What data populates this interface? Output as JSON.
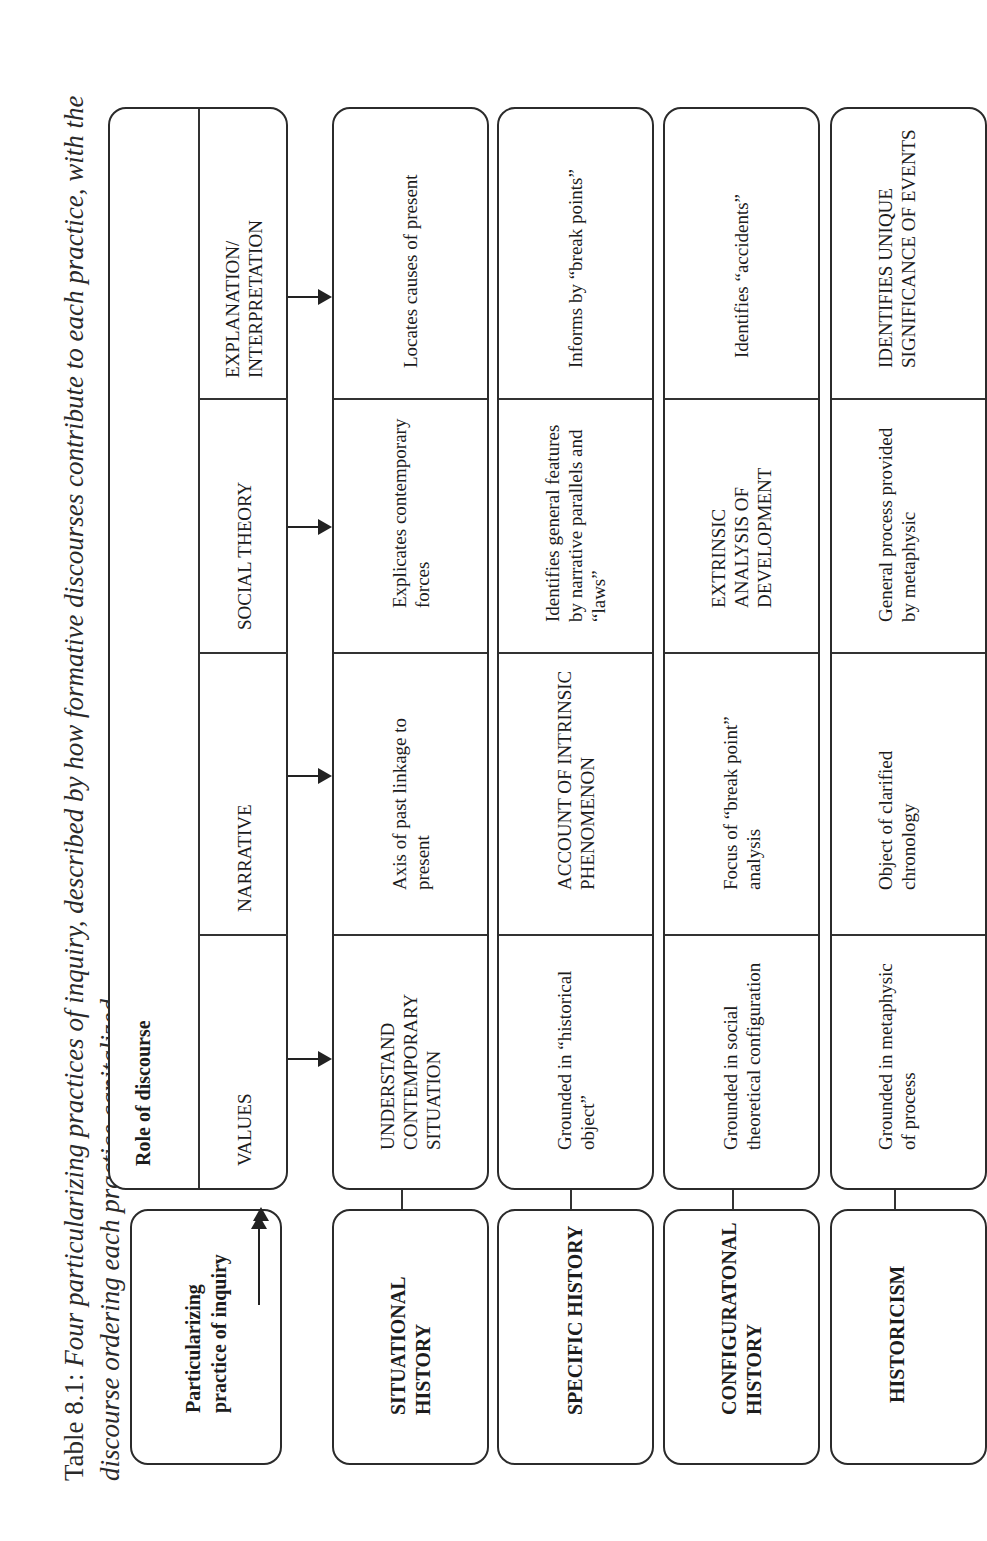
{
  "caption": {
    "label": "Table 8.1:",
    "text": "Four particularizing practices of inquiry, described by how formative discourses contribute to each practice, with the discourse ordering each practice capitalized"
  },
  "header": {
    "practice_label": "Particularizing practice of inquiry",
    "role_label": "Role of discourse",
    "columns": [
      "VALUES",
      "NARRATIVE",
      "SOCIAL THEORY",
      "EXPLANATION/ INTERPRETATION"
    ]
  },
  "rows": [
    {
      "practice": "SITUATIONAL HISTORY",
      "values": "UNDERSTAND CONTEMPORARY SITUATION",
      "narrative": "Axis of past linkage to present",
      "social_theory": "Explicates contemporary forces",
      "explanation": "Locates causes of present"
    },
    {
      "practice": "SPECIFIC HISTORY",
      "values": "Grounded in “historical object”",
      "narrative": "ACCOUNT OF INTRINSIC PHENOMENON",
      "social_theory": "Identifies general features by narrative parallels and “laws”",
      "explanation": "Informs by “break points”"
    },
    {
      "practice": "CONFIGURATONAL HISTORY",
      "values": "Grounded in social theoretical configuration",
      "narrative": "Focus of “break point” analysis",
      "social_theory": "EXTRINSIC ANALYSIS OF DEVELOPMENT",
      "explanation": "Identifies “accidents”"
    },
    {
      "practice": "HISTORICISM",
      "values": "Grounded in metaphysic of process",
      "narrative": "Object of clarified chronology",
      "social_theory": "General process provided by metaphysic",
      "explanation": "IDENTIFIES UNIQUE SIGNIFICANCE OF EVENTS"
    }
  ]
}
